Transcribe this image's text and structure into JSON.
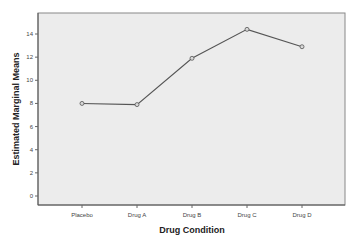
{
  "chart_data": {
    "type": "line",
    "title": "",
    "xlabel": "Drug Condition",
    "ylabel": "Estimated Marginal Means",
    "categories": [
      "Placebo",
      "Drug A",
      "Drug B",
      "Drug C",
      "Drug D"
    ],
    "series": [
      {
        "name": "Estimated Marginal Means",
        "values": [
          8.0,
          7.9,
          11.9,
          14.4,
          12.9
        ]
      }
    ],
    "y_ticks": [
      0,
      2,
      4,
      6,
      8,
      10,
      12,
      14
    ],
    "y_tick_labels": [
      "0",
      "2",
      "4",
      "6",
      "8",
      "10",
      "12",
      "14"
    ],
    "ylim": [
      -0.8,
      15.6
    ],
    "grid": false,
    "legend": "none",
    "marker": "circle",
    "colors": {
      "plot_background": "#ececec",
      "line": "#555555",
      "marker_fill": "#d8d8d8",
      "axis": "#666666"
    }
  }
}
